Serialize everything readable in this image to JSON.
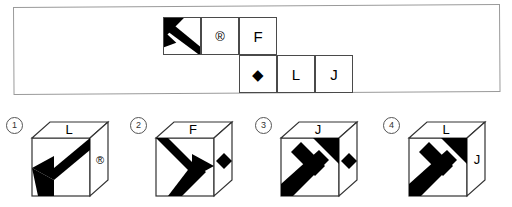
{
  "puzzle": {
    "type": "cube-folding-question",
    "net": {
      "rows": 2,
      "cols": 4,
      "cells": [
        {
          "row": 0,
          "col": 0,
          "content": "arrow",
          "icon": "arrow-up-left-icon",
          "label": ""
        },
        {
          "row": 0,
          "col": 1,
          "content": "symbol",
          "icon": "registered-trademark-icon",
          "label": "®"
        },
        {
          "row": 0,
          "col": 2,
          "content": "letter",
          "icon": "letter-f-icon",
          "label": "F"
        },
        {
          "row": 1,
          "col": 2,
          "content": "symbol",
          "icon": "black-diamond-icon",
          "label": "◆"
        },
        {
          "row": 1,
          "col": 3,
          "content": "letter",
          "icon": "letter-l-icon",
          "label": "L"
        },
        {
          "row": 1,
          "col": 4,
          "content": "letter",
          "icon": "letter-j-icon",
          "label": "J"
        }
      ]
    }
  },
  "options": [
    {
      "number": "①",
      "number_plain": "1",
      "top_face": "L",
      "right_face": "®",
      "right_face_icon": "registered-trademark-icon",
      "front_face_icon": "arrow-left-icon",
      "arrow_direction": "left"
    },
    {
      "number": "②",
      "number_plain": "2",
      "top_face": "F",
      "right_face": "◆",
      "right_face_icon": "black-diamond-icon",
      "front_face_icon": "arrow-right-icon",
      "arrow_direction": "right"
    },
    {
      "number": "③",
      "number_plain": "3",
      "top_face": "J",
      "right_face": "◆",
      "right_face_icon": "black-diamond-icon",
      "front_face_icon": "arrow-up-right-icon",
      "arrow_direction": "up-right"
    },
    {
      "number": "④",
      "number_plain": "4",
      "top_face": "L",
      "right_face": "J",
      "right_face_icon": "letter-j-icon",
      "front_face_icon": "arrow-up-right-icon",
      "arrow_direction": "up-right"
    }
  ],
  "colors": {
    "ink": "#000000",
    "border": "#4a4a4a",
    "panel_border": "#9a9a9a",
    "background": "#ffffff"
  }
}
